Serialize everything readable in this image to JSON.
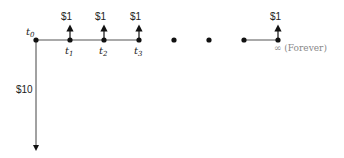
{
  "diagram": {
    "initial_outflow": {
      "label": "$10",
      "time": "t0"
    },
    "time_labels": [
      {
        "base": "t",
        "sub": "0"
      },
      {
        "base": "t",
        "sub": "1"
      },
      {
        "base": "t",
        "sub": "2"
      },
      {
        "base": "t",
        "sub": "3"
      }
    ],
    "inflows": [
      "$1",
      "$1",
      "$1",
      "$1"
    ],
    "continuation": "• • •",
    "forever_label": "∞ (Forever)",
    "colors": {
      "line": "#555555",
      "dot": "#111111",
      "text": "#222222",
      "muted": "#888888"
    }
  }
}
